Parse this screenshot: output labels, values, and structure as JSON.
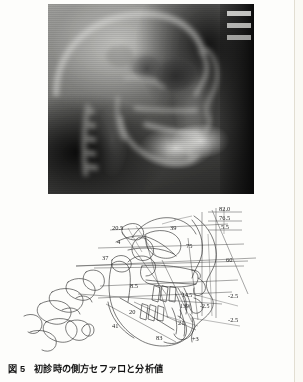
{
  "figure": {
    "caption_number": "図 5",
    "caption_text": "初診時の側方セファロと分析値",
    "photo_alt": "lateral-cephalometric-radiograph",
    "tracing_alt": "cephalometric-tracing-with-measurements"
  },
  "measurements": {
    "top_stack": [
      {
        "id": "m-82-0",
        "value": "82.0"
      },
      {
        "id": "m-76-5",
        "value": "76.5"
      },
      {
        "id": "m-5-5",
        "value": "5.5"
      }
    ],
    "upper_left": [
      {
        "id": "m-20-5",
        "value": "20.5"
      },
      {
        "id": "m-4",
        "value": "4"
      },
      {
        "id": "m-37",
        "value": "37"
      }
    ],
    "upper_mid": [
      {
        "id": "m-39",
        "value": "39"
      },
      {
        "id": "m-75",
        "value": "75"
      }
    ],
    "right_side": [
      {
        "id": "m-60",
        "value": "60"
      },
      {
        "id": "m-n2-5-a",
        "value": "-2.5"
      },
      {
        "id": "m-n2-5-b",
        "value": "-2.5"
      }
    ],
    "mid_left": [
      {
        "id": "m-8-5",
        "value": "8.5"
      },
      {
        "id": "m-20",
        "value": "20"
      },
      {
        "id": "m-41",
        "value": "41"
      }
    ],
    "mid_right": [
      {
        "id": "m-14-5",
        "value": "14.5"
      },
      {
        "id": "m-139",
        "value": "139"
      },
      {
        "id": "m-n2-5-c",
        "value": "-2.5"
      }
    ],
    "lower": [
      {
        "id": "m-21",
        "value": "21"
      },
      {
        "id": "m-83",
        "value": "83"
      },
      {
        "id": "m-p3",
        "value": "+3"
      }
    ]
  },
  "colors": {
    "ink": "#2b2b2b",
    "paper": "#fdfdfb",
    "page_edge": "#e2ded2"
  }
}
